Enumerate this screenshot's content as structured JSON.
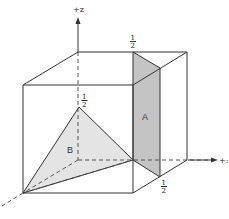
{
  "diagram": {
    "axes": {
      "z_label": "+z",
      "y_label": "+:",
      "x_label": ""
    },
    "tick_labels": {
      "top_half_num": "1",
      "top_half_den": "2",
      "z_half_num": "1",
      "z_half_den": "2",
      "bottom_half_num": "1",
      "bottom_half_den": "2"
    },
    "planes": {
      "A": {
        "label": "A",
        "fill": "#c4c4c4"
      },
      "B": {
        "label": "B",
        "fill": "#e4e4e4"
      }
    },
    "colors": {
      "edge": "#333333",
      "background": "#ffffff"
    }
  }
}
